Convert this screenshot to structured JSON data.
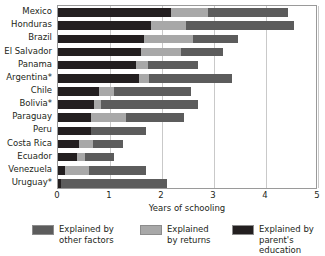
{
  "chart_data": {
    "type": "bar",
    "orientation": "horizontal",
    "stacked": true,
    "title": "",
    "xlabel": "Years of schooling",
    "ylabel": "",
    "xlim": [
      0,
      5
    ],
    "xticks": [
      0,
      1,
      2,
      3,
      4,
      5
    ],
    "xtick_labels": [
      "0",
      "1",
      "2",
      "3",
      "4",
      "5"
    ],
    "grid": true,
    "grid_axis": "x",
    "legend_position": "bottom",
    "categories": [
      "Mexico",
      "Honduras",
      "Brazil",
      "El Salvador",
      "Panama",
      "Argentina*",
      "Chile",
      "Bolivia*",
      "Paraguay",
      "Peru",
      "Costa Rica",
      "Ecuador",
      "Venezuela",
      "Uruguay*"
    ],
    "series": [
      {
        "name": "Explained by parent's education",
        "color": "#231f20",
        "values": [
          2.17,
          1.79,
          1.65,
          1.6,
          1.5,
          1.56,
          0.79,
          0.69,
          0.63,
          0.63,
          0.4,
          0.37,
          0.13,
          0.06
        ]
      },
      {
        "name": "Explained by returns",
        "color": "#a8a8a8",
        "values": [
          0.71,
          0.67,
          0.94,
          0.77,
          0.23,
          0.19,
          0.29,
          0.13,
          0.67,
          0.0,
          0.27,
          0.15,
          0.46,
          0.0
        ]
      },
      {
        "name": "Explained by other factors",
        "color": "#5c5c5c",
        "values": [
          1.54,
          2.08,
          0.87,
          0.81,
          0.96,
          1.6,
          1.48,
          1.87,
          1.12,
          1.06,
          0.58,
          0.56,
          1.1,
          2.04
        ]
      }
    ],
    "totals": [
      4.42,
      4.54,
      3.46,
      3.18,
      2.69,
      3.35,
      2.56,
      2.69,
      2.42,
      1.69,
      1.25,
      1.08,
      1.69,
      2.1
    ]
  },
  "legend": {
    "entries": [
      {
        "label": "Explained by\nother factors",
        "color": "#5c5c5c",
        "swatch_name": "legend-swatch-other-factors"
      },
      {
        "label": "Explained\nby returns",
        "color": "#a8a8a8",
        "swatch_name": "legend-swatch-returns"
      },
      {
        "label": "Explained by\nparent's education",
        "color": "#231f20",
        "swatch_name": "legend-swatch-parents-education"
      }
    ]
  },
  "axis": {
    "x_title": "Years of schooling"
  },
  "colors": {
    "parents_education": "#231f20",
    "returns": "#a8a8a8",
    "other_factors": "#5c5c5c",
    "gridline": "#c9c9c9",
    "frame": "#9a9a9a",
    "background": "#ffffff"
  }
}
